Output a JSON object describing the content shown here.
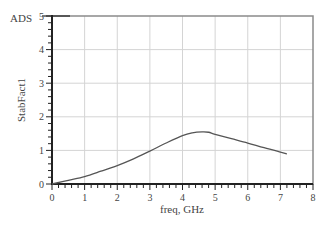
{
  "corner_label": "ADS",
  "chart_data": {
    "type": "line",
    "title": "",
    "xlabel": "freq, GHz",
    "ylabel": "StabFact1",
    "xlim": [
      0,
      8
    ],
    "ylim": [
      0,
      5
    ],
    "xticks": [
      0,
      1,
      2,
      3,
      4,
      5,
      6,
      7,
      8
    ],
    "yticks": [
      0,
      1,
      2,
      3,
      4,
      5
    ],
    "grid": true,
    "legend": null,
    "series": [
      {
        "name": "StabFact1",
        "color": "#555555",
        "x": [
          0.0,
          0.5,
          1.0,
          1.5,
          2.0,
          2.5,
          3.0,
          3.5,
          4.0,
          4.3,
          4.6,
          4.8,
          5.0,
          5.5,
          6.0,
          6.5,
          7.0,
          7.2
        ],
        "y": [
          0.0,
          0.11,
          0.22,
          0.38,
          0.55,
          0.75,
          0.98,
          1.22,
          1.44,
          1.52,
          1.55,
          1.54,
          1.48,
          1.35,
          1.22,
          1.08,
          0.95,
          0.9
        ]
      }
    ]
  }
}
